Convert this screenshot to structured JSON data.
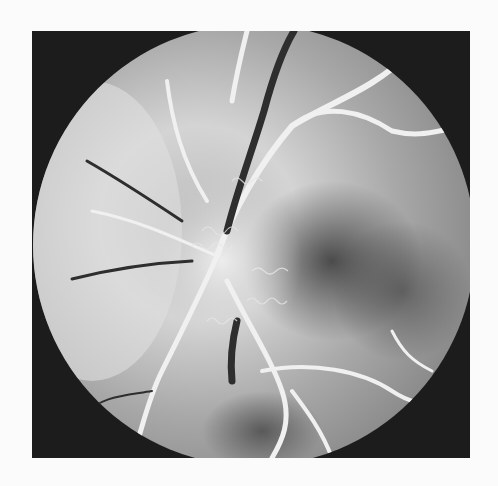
{
  "image": {
    "subject": "fundus fluorescein angiogram",
    "colors": {
      "page_background": "#fbfbfb",
      "frame": "#1c1c1c",
      "retina_light": "#d8d8d8",
      "retina_mid": "#a0a0a0",
      "retina_dark": "#4a4a4a",
      "vessel_bright": "#f2f2f2",
      "vein_dark": "#2a2a2a"
    }
  }
}
